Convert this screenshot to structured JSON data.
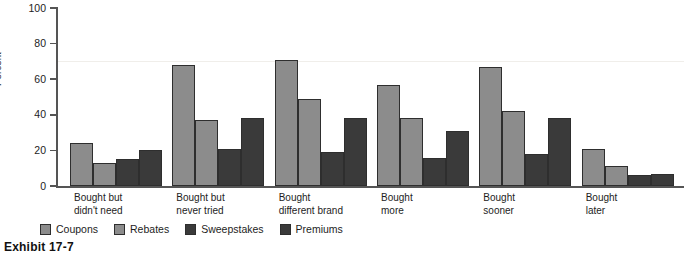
{
  "caption": "Exhibit 17-7",
  "chart_data": {
    "type": "bar",
    "title": "",
    "xlabel": "",
    "ylabel": "Percent",
    "ylim": [
      0,
      100
    ],
    "yticks": [
      0,
      20,
      40,
      60,
      80,
      100
    ],
    "ytick_labels": [
      "0",
      "20",
      "40",
      "60",
      "80",
      "100"
    ],
    "grid": false,
    "legend_position": "bottom-center",
    "categories": [
      "Bought but\ndidn't need",
      "Bought but\nnever tried",
      "Bought\ndifferent brand",
      "Bought\nmore",
      "Bought\nsooner",
      "Bought\nlater"
    ],
    "series": [
      {
        "name": "Coupons",
        "color": "#8c8c8c",
        "values": [
          24,
          68,
          71,
          57,
          67,
          21
        ]
      },
      {
        "name": "Rebates",
        "color": "#8c8c8c",
        "values": [
          13,
          37,
          49,
          38,
          42,
          11
        ]
      },
      {
        "name": "Sweepstakes",
        "color": "#3a3a3a",
        "values": [
          15,
          21,
          19,
          16,
          18,
          6
        ]
      },
      {
        "name": "Premiums",
        "color": "#3a3a3a",
        "values": [
          20,
          38,
          38,
          31,
          38,
          7
        ]
      }
    ]
  }
}
